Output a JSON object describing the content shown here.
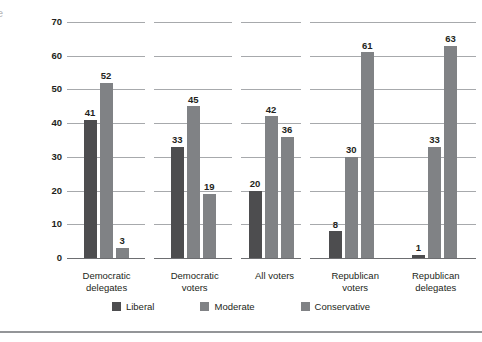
{
  "edge_glyph": "e",
  "chart_data": {
    "type": "bar",
    "title": "",
    "xlabel": "",
    "ylabel": "Percentage of respondents",
    "ylim": [
      0,
      70
    ],
    "ytick_step": 10,
    "yticks": [
      "0",
      "10",
      "20",
      "30",
      "40",
      "50",
      "60",
      "70"
    ],
    "grid": true,
    "legend_position": "bottom",
    "categories": [
      "Democratic delegates",
      "Democratic voters",
      "All voters",
      "Republican voters",
      "Republican delegates"
    ],
    "series": [
      {
        "name": "Liberal",
        "color": "#4d4d4f",
        "values": [
          41,
          33,
          20,
          8,
          1
        ]
      },
      {
        "name": "Moderate",
        "color": "#808285",
        "values": [
          52,
          45,
          42,
          30,
          33
        ]
      },
      {
        "name": "Conservative",
        "color": "#808285",
        "values": [
          3,
          19,
          36,
          61,
          63
        ]
      }
    ]
  },
  "panels": [
    {
      "id": "democratic-delegates",
      "label_line1": "Democratic",
      "label_line2": "delegates",
      "groups": [
        {
          "bars": [
            {
              "series": "Liberal",
              "value": 41,
              "label": "41"
            },
            {
              "series": "Moderate",
              "value": 52,
              "label": "52"
            },
            {
              "series": "Conservative",
              "value": 3,
              "label": "3"
            }
          ]
        }
      ]
    },
    {
      "id": "democratic-voters",
      "label_line1": "Democratic",
      "label_line2": "voters",
      "groups": [
        {
          "bars": [
            {
              "series": "Liberal",
              "value": 33,
              "label": "33"
            },
            {
              "series": "Moderate",
              "value": 45,
              "label": "45"
            },
            {
              "series": "Conservative",
              "value": 19,
              "label": "19"
            }
          ]
        }
      ]
    },
    {
      "id": "all-voters",
      "label_line1": "All voters",
      "label_line2": "",
      "groups": [
        {
          "bars": [
            {
              "series": "Liberal",
              "value": 20,
              "label": "20"
            },
            {
              "series": "Moderate",
              "value": 42,
              "label": "42"
            },
            {
              "series": "Conservative",
              "value": 36,
              "label": "36"
            }
          ]
        }
      ]
    },
    {
      "id": "republican",
      "label_line1": "Republican",
      "label_line2": "voters",
      "label2_line1": "Republican",
      "label2_line2": "delegates",
      "groups": [
        {
          "bars": [
            {
              "series": "Liberal",
              "value": 8,
              "label": "8"
            },
            {
              "series": "Moderate",
              "value": 30,
              "label": "30"
            },
            {
              "series": "Conservative",
              "value": 61,
              "label": "61"
            }
          ]
        },
        {
          "bars": [
            {
              "series": "Liberal",
              "value": 1,
              "label": "1"
            },
            {
              "series": "Moderate",
              "value": 33,
              "label": "33"
            },
            {
              "series": "Conservative",
              "value": 63,
              "label": "63"
            }
          ]
        }
      ]
    }
  ],
  "legend": [
    {
      "label": "Liberal",
      "color": "#4d4d4f"
    },
    {
      "label": "Moderate",
      "color": "#808285"
    },
    {
      "label": "Conservative",
      "color": "#808285"
    }
  ]
}
